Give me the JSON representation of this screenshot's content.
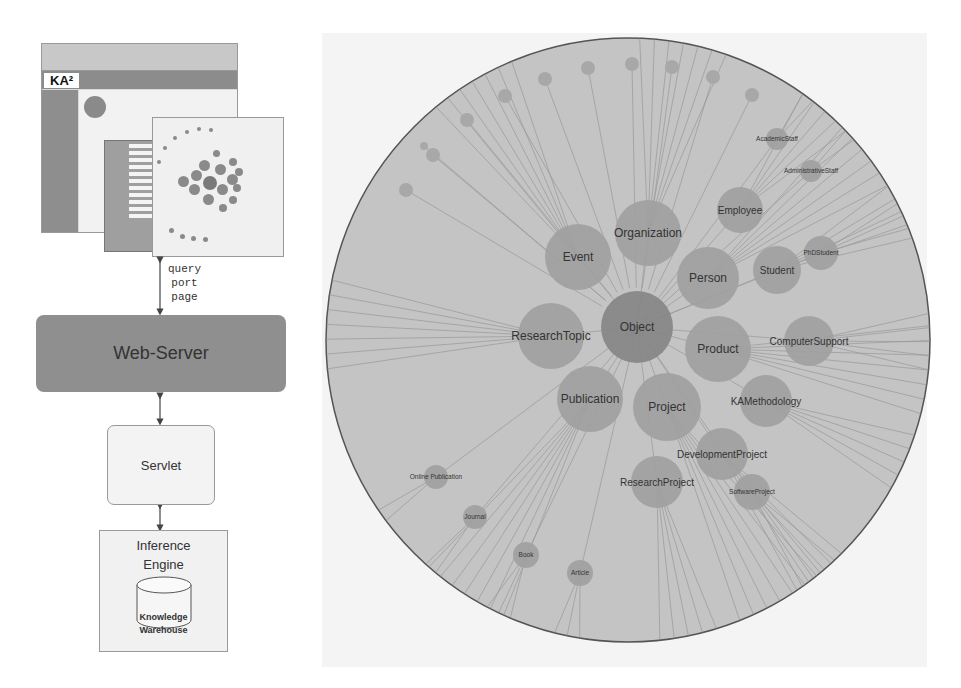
{
  "architecture": {
    "screenshot": {
      "logo": "KA²",
      "description": "KA2 portal web page screenshot with hyperbolic ontology browser"
    },
    "connection_labels": [
      "query",
      "port",
      "page"
    ],
    "webserver_label": "Web-Server",
    "servlet_label": "Servlet",
    "inference_engine_label_line1": "Inference",
    "inference_engine_label_line2": "Engine",
    "warehouse_label_line1": "Knowledge",
    "warehouse_label_line2": "Warehouse"
  },
  "graph": {
    "center": {
      "x": 628,
      "y": 340,
      "r": 302
    },
    "colors": {
      "disc": "#c4c4c4",
      "disc_border": "#555555",
      "node": "#a0a0a0",
      "node_center": "#858585",
      "node_small": "#a8a8a8",
      "edge": "#8a8a8a",
      "label": "#333333"
    },
    "nodes": [
      {
        "label": "Object",
        "x": 637,
        "y": 327,
        "r": 36,
        "center": true
      },
      {
        "label": "Organization",
        "x": 648,
        "y": 233,
        "r": 33
      },
      {
        "label": "Event",
        "x": 578,
        "y": 257,
        "r": 33
      },
      {
        "label": "Person",
        "x": 708,
        "y": 278,
        "r": 31
      },
      {
        "label": "ResearchTopic",
        "x": 551,
        "y": 336,
        "r": 33
      },
      {
        "label": "Product",
        "x": 718,
        "y": 349,
        "r": 33
      },
      {
        "label": "Publication",
        "x": 590,
        "y": 399,
        "r": 33
      },
      {
        "label": "Project",
        "x": 667,
        "y": 407,
        "r": 34
      },
      {
        "label": "Employee",
        "x": 740,
        "y": 210,
        "r": 23
      },
      {
        "label": "Student",
        "x": 777,
        "y": 270,
        "r": 24
      },
      {
        "label": "PhDStudent",
        "x": 821,
        "y": 253,
        "r": 17
      },
      {
        "label": "ComputerSupport",
        "x": 809,
        "y": 341,
        "r": 25
      },
      {
        "label": "KAMethodology",
        "x": 766,
        "y": 401,
        "r": 26
      },
      {
        "label": "DevelopmentProject",
        "x": 722,
        "y": 454,
        "r": 26
      },
      {
        "label": "ResearchProject",
        "x": 657,
        "y": 482,
        "r": 26
      },
      {
        "label": "SoftwareProject",
        "x": 752,
        "y": 492,
        "r": 18
      },
      {
        "label": "AcademicStaff",
        "x": 777,
        "y": 139,
        "r": 11
      },
      {
        "label": "AdministrativeStaff",
        "x": 811,
        "y": 171,
        "r": 11
      },
      {
        "label": "Online Publication",
        "x": 436,
        "y": 477,
        "r": 12
      },
      {
        "label": "Journal",
        "x": 475,
        "y": 517,
        "r": 12
      },
      {
        "label": "Book",
        "x": 526,
        "y": 555,
        "r": 13
      },
      {
        "label": "Article",
        "x": 580,
        "y": 573,
        "r": 13
      }
    ],
    "small_nodes": [
      {
        "x": 406,
        "y": 190,
        "r": 7
      },
      {
        "x": 424,
        "y": 146,
        "r": 4
      },
      {
        "x": 433,
        "y": 155,
        "r": 7
      },
      {
        "x": 467,
        "y": 120,
        "r": 7
      },
      {
        "x": 505,
        "y": 96,
        "r": 7
      },
      {
        "x": 545,
        "y": 79,
        "r": 7
      },
      {
        "x": 588,
        "y": 68,
        "r": 7
      },
      {
        "x": 632,
        "y": 64,
        "r": 7
      },
      {
        "x": 672,
        "y": 67,
        "r": 7
      },
      {
        "x": 713,
        "y": 77,
        "r": 7
      },
      {
        "x": 752,
        "y": 95,
        "r": 7
      }
    ]
  }
}
